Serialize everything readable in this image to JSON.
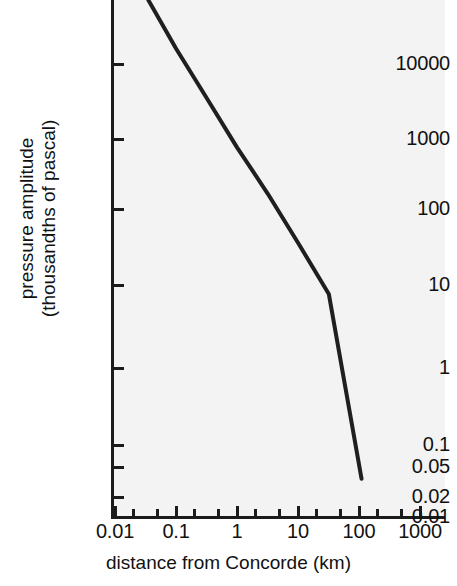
{
  "chart_data": {
    "type": "line",
    "title": "",
    "subtitle": "",
    "xlabel": "distance from Concorde (km)",
    "ylabel": "pressure amplitude (thousandths of pascal)",
    "ylabel_lines": [
      "pressure amplitude",
      "(thousandths of pascal)"
    ],
    "xscale": "log",
    "yscale": "log",
    "xlim": [
      0.01,
      1000
    ],
    "ylim": [
      0.01,
      100000
    ],
    "grid": false,
    "legend": null,
    "xticks": [
      {
        "value": 0.01,
        "label": "0.01",
        "major": true
      },
      {
        "value": 0.1,
        "label": "0.1",
        "major": true
      },
      {
        "value": 1,
        "label": "1",
        "major": true
      },
      {
        "value": 10,
        "label": "10",
        "major": true
      },
      {
        "value": 100,
        "label": "100",
        "major": true
      },
      {
        "value": 1000,
        "label": "1000",
        "major": true
      }
    ],
    "xminor_ticks": [
      0.02,
      0.05,
      0.2,
      0.5,
      2,
      5,
      20,
      50,
      200,
      500
    ],
    "yticks": [
      {
        "value": 10000,
        "label": "10000",
        "major": true
      },
      {
        "value": 1000,
        "label": "1000",
        "major": true
      },
      {
        "value": 100,
        "label": "100",
        "major": true
      },
      {
        "value": 10,
        "label": "10",
        "major": true
      },
      {
        "value": 1,
        "label": "1",
        "major": true
      },
      {
        "value": 0.1,
        "label": "0.1",
        "major": true
      },
      {
        "value": 0.05,
        "label": "0.05",
        "major": true
      },
      {
        "value": 0.02,
        "label": "0.02",
        "major": true
      },
      {
        "value": 0.01,
        "label": "0.01",
        "major": true
      }
    ],
    "series": [
      {
        "name": "sonic boom pressure amplitude",
        "color": "#1f1f1f",
        "linewidth": 4,
        "x": [
          0.035,
          0.1,
          0.32,
          1,
          3.2,
          10,
          32,
          110
        ],
        "y": [
          70000,
          16000,
          3500,
          760,
          165,
          36,
          7.8,
          0.035
        ]
      }
    ],
    "annotations": []
  },
  "colors": {
    "plot_background": "#f3f3f3",
    "page_background": "#ffffff",
    "axis": "#1b1b1b",
    "line": "#1f1f1f",
    "text": "#111111"
  }
}
